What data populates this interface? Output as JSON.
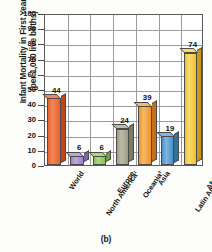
{
  "figure": {
    "caption": "(b)"
  },
  "chart_data": {
    "type": "bar",
    "title": "",
    "subtitle": "",
    "xlabel": "",
    "ylabel": "Infant Mortality in First Year (per 1,000 live births)",
    "ylabel_lines": [
      "Infant Mortality in First Year",
      "(per 1,000 live births)"
    ],
    "categories": [
      "World",
      "North America¹",
      "Europe",
      "Oceania²",
      "Asia",
      "Latin America and the Caribbean",
      "Africa"
    ],
    "category_lines": [
      [
        "World"
      ],
      [
        "North America¹"
      ],
      [
        "Europe"
      ],
      [
        "Oceania²"
      ],
      [
        "Asia"
      ],
      [
        "Latin America",
        "and the",
        "Caribbean"
      ],
      [
        "Africa"
      ]
    ],
    "values": [
      44,
      6,
      6,
      24,
      39,
      19,
      74
    ],
    "value_labels": [
      "44",
      "6",
      "6",
      "24",
      "39",
      "19",
      "74"
    ],
    "bar_colors": [
      "#E8622A",
      "#9B84C4",
      "#8CC152",
      "#9C9C86",
      "#F0932B",
      "#4A90C4",
      "#F2C029"
    ],
    "bar_colors_top": [
      "#F2865A",
      "#BBA9DC",
      "#AFD97E",
      "#BCBCA8",
      "#F8B867",
      "#7FB6DE",
      "#F8DC72"
    ],
    "bar_colors_side": [
      "#BC4718",
      "#7A63A2",
      "#6EA13A",
      "#7B7B68",
      "#C3701A",
      "#33709E",
      "#C69A12"
    ],
    "ylim": [
      0,
      100
    ],
    "yticks": [
      0,
      10,
      20,
      30,
      40,
      50,
      60,
      70,
      80,
      90,
      100
    ],
    "ytick_labels": [
      "0",
      "10",
      "20",
      "30",
      "40",
      "50",
      "60",
      "70",
      "80",
      "90",
      "100"
    ],
    "grid": true,
    "grid_horizontal": true,
    "grid_vertical": true,
    "legend": false,
    "legend_position": "none"
  }
}
